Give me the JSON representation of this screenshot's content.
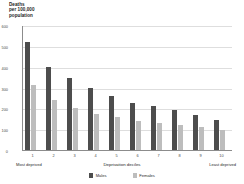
{
  "chart_data": {
    "type": "bar",
    "title": "",
    "subtitle": "",
    "xlabel": "Deprivation deciles",
    "ylabel": "Deaths per 100,000 population",
    "ylabel_lines": [
      "Deaths",
      "per 100,000",
      "population"
    ],
    "categories": [
      "1",
      "2",
      "3",
      "4",
      "5",
      "6",
      "7",
      "8",
      "9",
      "10"
    ],
    "ylim": [
      0,
      600
    ],
    "yticks": [
      0,
      100,
      200,
      300,
      400,
      500,
      600
    ],
    "ytick_labels": [
      "0",
      "100",
      "200",
      "300",
      "400",
      "500",
      "600"
    ],
    "grid": true,
    "legend_position": "bottom",
    "series": [
      {
        "name": "Males",
        "color": "#4d4d4d",
        "values": [
          520,
          400,
          347,
          297,
          257,
          228,
          213,
          192,
          170,
          143
        ]
      },
      {
        "name": "Females",
        "color": "#bdbdbd",
        "values": [
          310,
          242,
          202,
          175,
          157,
          140,
          128,
          122,
          110,
          95
        ]
      }
    ],
    "annotations": {
      "x_axis_left_end": "Most deprived",
      "x_axis_right_end": "Least deprived"
    }
  },
  "legend": {
    "items": [
      {
        "label": "Males",
        "color": "#4d4d4d"
      },
      {
        "label": "Females",
        "color": "#bdbdbd"
      }
    ]
  }
}
